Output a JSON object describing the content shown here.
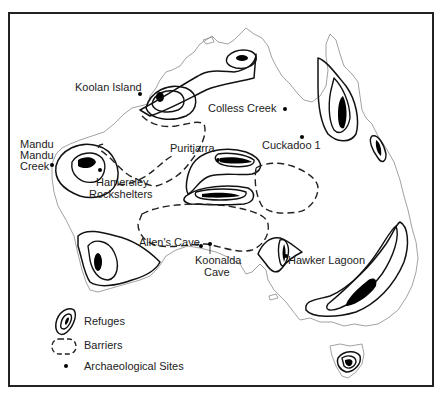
{
  "map": {
    "subject": "Australia",
    "sites": [
      {
        "id": "koolan",
        "name": "Koolan Island",
        "lines": [
          "Koolan Island"
        ]
      },
      {
        "id": "colless",
        "name": "Colless Creek",
        "lines": [
          "Colless Creek"
        ]
      },
      {
        "id": "cuckadoo",
        "name": "Cuckadoo 1",
        "lines": [
          "Cuckadoo 1"
        ]
      },
      {
        "id": "mandu",
        "name": "Mandu Mandu Creek",
        "lines": [
          "Mandu",
          "Mandu",
          "Creek"
        ]
      },
      {
        "id": "puritjarra",
        "name": "Puritjarra",
        "lines": [
          "Puritjarra"
        ]
      },
      {
        "id": "hamersley",
        "name": "Hamersley Rockshelters",
        "lines": [
          "Hamersley",
          "Rockshelters"
        ]
      },
      {
        "id": "allens",
        "name": "Allen's Cave",
        "lines": [
          "Allen's Cave"
        ]
      },
      {
        "id": "koonalda",
        "name": "Koonalda Cave",
        "lines": [
          "Koonalda",
          "Cave"
        ]
      },
      {
        "id": "hawker",
        "name": "Hawker Lagoon",
        "lines": [
          "Hawker Lagoon"
        ]
      }
    ]
  },
  "legend": {
    "items": [
      {
        "symbol": "refuge-icon",
        "label": "Refuges"
      },
      {
        "symbol": "barrier-icon",
        "label": "Barriers"
      },
      {
        "symbol": "site-dot-icon",
        "label": "Archaeological Sites"
      }
    ]
  }
}
